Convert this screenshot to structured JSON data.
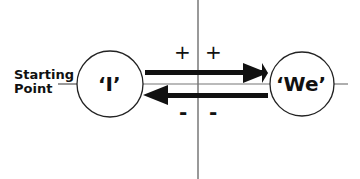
{
  "diagram": {
    "start_label_line1": "Starting",
    "start_label_line2": "Point",
    "left_node": "‘I’",
    "right_node": "‘We’",
    "plus_left": "+",
    "plus_right": "+",
    "minus_left": "-",
    "minus_right": "-",
    "colors": {
      "line": "#777777",
      "arrow": "#111111",
      "text": "#111111"
    }
  }
}
